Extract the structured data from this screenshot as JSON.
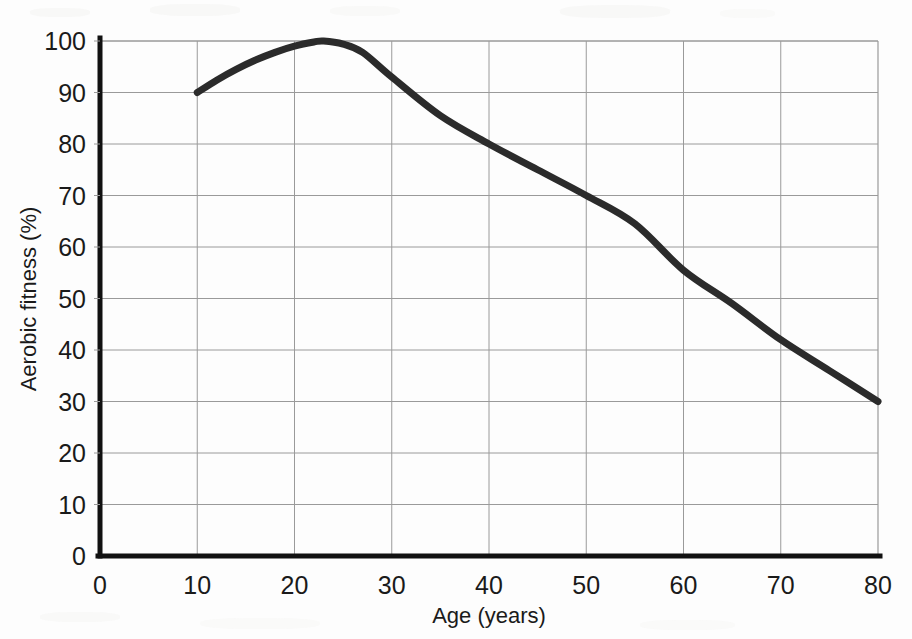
{
  "chart_data": {
    "type": "line",
    "title": "",
    "subtitle": "",
    "xlabel": "Age (years)",
    "ylabel": "Aerobic fitness (%)",
    "xlim": [
      0,
      80
    ],
    "ylim": [
      0,
      100
    ],
    "xticks": [
      0,
      10,
      20,
      30,
      40,
      50,
      60,
      70,
      80
    ],
    "yticks": [
      0,
      10,
      20,
      30,
      40,
      50,
      60,
      70,
      80,
      90,
      100
    ],
    "xtick_labels": [
      "0",
      "10",
      "20",
      "30",
      "40",
      "50",
      "60",
      "70",
      "80"
    ],
    "ytick_labels": [
      "0",
      "10",
      "20",
      "30",
      "40",
      "50",
      "60",
      "70",
      "80",
      "90",
      "100"
    ],
    "grid": true,
    "grid_color": "#9a9a9a",
    "legend": false,
    "legend_position": "none",
    "line_color": "#2b2b2b",
    "line_width": 7,
    "series": [
      {
        "name": "Aerobic fitness",
        "x": [
          10,
          12,
          14,
          16,
          18,
          20,
          22,
          23,
          25,
          27,
          30,
          35,
          40,
          45,
          50,
          55,
          60,
          65,
          70,
          75,
          80
        ],
        "values": [
          90.0,
          92.4,
          94.5,
          96.3,
          97.8,
          99.0,
          99.8,
          100.0,
          99.4,
          97.8,
          93.0,
          85.5,
          80.0,
          75.0,
          70.0,
          64.5,
          55.5,
          49.0,
          42.0,
          36.0,
          30.0
        ]
      }
    ],
    "annotations": [
      {
        "text": "peak fitness at approximately age 23 (100%)",
        "x": 23,
        "y": 100
      },
      {
        "text": "start of plotted data at age 10 (90%)",
        "x": 10,
        "y": 90
      },
      {
        "text": "end of plotted data at age 80 (30%)",
        "x": 80,
        "y": 30
      }
    ]
  },
  "axes": {
    "x_title": "Age (years)",
    "y_title": "Aerobic fitness (%)"
  }
}
